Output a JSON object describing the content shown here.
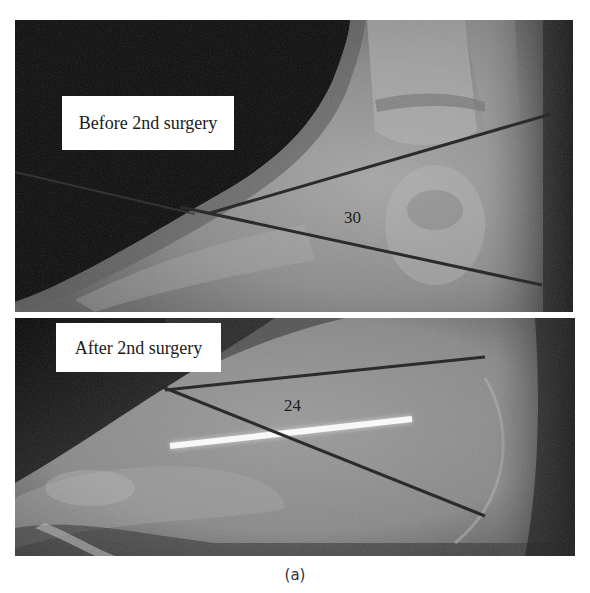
{
  "figure": {
    "caption": "(a)",
    "panels": [
      {
        "id": "before",
        "label": "Before 2nd surgery",
        "angle_value": "30",
        "angle_unit_implied": "degrees",
        "lines": [
          {
            "name": "upper-axis-line",
            "x1": 195,
            "y1": 193,
            "x2": 536,
            "y2": 94
          },
          {
            "name": "lower-axis-line",
            "x1": 165,
            "y1": 187,
            "x2": 527,
            "y2": 265
          },
          {
            "name": "faint-reference-line",
            "x1": 0,
            "y1": 152,
            "x2": 180,
            "y2": 194
          }
        ]
      },
      {
        "id": "after",
        "label": "After 2nd surgery",
        "angle_value": "24",
        "angle_unit_implied": "degrees",
        "lines": [
          {
            "name": "upper-axis-line",
            "x1": 150,
            "y1": 72,
            "x2": 470,
            "y2": 39
          },
          {
            "name": "lower-axis-line",
            "x1": 145,
            "y1": 68,
            "x2": 470,
            "y2": 198
          }
        ],
        "implant": {
          "name": "k-wire",
          "x1": 155,
          "y1": 128,
          "x2": 397,
          "y2": 101
        }
      }
    ],
    "colors": {
      "background": "#ffffff",
      "label_bg": "#ffffff",
      "label_text": "#1a1a1a",
      "measure_line": "#2b2b2b",
      "implant": "#f8f8f8"
    }
  }
}
